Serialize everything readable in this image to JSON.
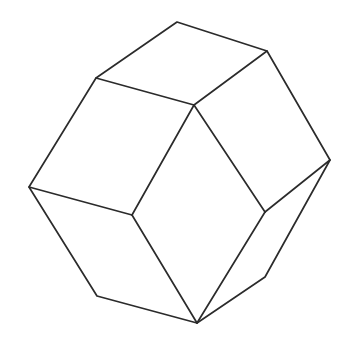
{
  "figure": {
    "type": "line-drawing",
    "background_color": "#ffffff",
    "stroke_color": "#2b2b2b",
    "fill_color": "#ffffff",
    "stroke_width": 1.7,
    "canvas": {
      "width": 350,
      "height": 345
    },
    "vertices": {
      "top_apex": {
        "name": "top-apex",
        "x": 177,
        "y": 22
      },
      "upper_right": {
        "name": "upper-right",
        "x": 267,
        "y": 51
      },
      "upper_left": {
        "name": "upper-left",
        "x": 96,
        "y": 78
      },
      "center": {
        "name": "center",
        "x": 194,
        "y": 105
      },
      "right": {
        "name": "right",
        "x": 330,
        "y": 160
      },
      "far_left": {
        "name": "far-left",
        "x": 29,
        "y": 187
      },
      "mid_left": {
        "name": "mid-left",
        "x": 132,
        "y": 215
      },
      "mid_right": {
        "name": "mid-right",
        "x": 265,
        "y": 212
      },
      "bottom_left": {
        "name": "bottom-left",
        "x": 97,
        "y": 296
      },
      "bottom_right": {
        "name": "bottom-right",
        "x": 265,
        "y": 277
      },
      "bottom_apex": {
        "name": "bottom-apex",
        "x": 197,
        "y": 323
      }
    },
    "silhouette_path": "M 177,22 L 267,51 L 330,160 L 265,277 L 197,323 L 97,296 L 29,187 L 96,78 Z",
    "faces": [
      {
        "name": "top-face",
        "points": "177,22 267,51 194,105 96,78",
        "description": "upper rhombic face"
      },
      {
        "name": "right-face",
        "points": "267,51 330,160 265,212 194,105",
        "description": "right rhombic face"
      },
      {
        "name": "front-face",
        "points": "194,105 265,212 197,323 132,215",
        "description": "front lower rhombic face"
      },
      {
        "name": "left-face",
        "points": "96,78 194,105 132,215 29,187",
        "description": "left rhombic face"
      }
    ],
    "internal_edges": [
      {
        "name": "edge-upper-left-to-center",
        "x1": 96,
        "y1": 78,
        "x2": 194,
        "y2": 105
      },
      {
        "name": "edge-upper-right-to-center",
        "x1": 267,
        "y1": 51,
        "x2": 194,
        "y2": 105
      },
      {
        "name": "edge-center-to-mid-left",
        "x1": 194,
        "y1": 105,
        "x2": 132,
        "y2": 215
      },
      {
        "name": "edge-center-to-mid-right",
        "x1": 194,
        "y1": 105,
        "x2": 265,
        "y2": 212
      },
      {
        "name": "edge-far-left-to-mid-left",
        "x1": 29,
        "y1": 187,
        "x2": 132,
        "y2": 215
      },
      {
        "name": "edge-mid-left-to-bottom-apex",
        "x1": 132,
        "y1": 215,
        "x2": 197,
        "y2": 323
      },
      {
        "name": "edge-right-to-mid-right",
        "x1": 330,
        "y1": 160,
        "x2": 265,
        "y2": 212
      },
      {
        "name": "edge-mid-right-to-bottom-apex",
        "x1": 265,
        "y1": 212,
        "x2": 197,
        "y2": 323
      }
    ]
  }
}
